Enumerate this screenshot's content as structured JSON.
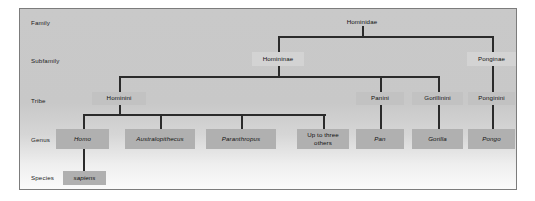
{
  "figure": {
    "panel_background": "#c9c9c9",
    "border_color": "#7c7c7c",
    "connector_color": "#2b2b2b"
  },
  "ranks": [
    {
      "id": "family",
      "label": "Family"
    },
    {
      "id": "subfamily",
      "label": "Subfamily"
    },
    {
      "id": "tribe",
      "label": "Tribe"
    },
    {
      "id": "genus",
      "label": "Genus"
    },
    {
      "id": "species",
      "label": "Species"
    }
  ],
  "nodes": {
    "family": [
      {
        "id": "hominidae",
        "label": "Hominidae",
        "box": "plain",
        "italic": false
      }
    ],
    "subfamily": [
      {
        "id": "homininae",
        "label": "Homininae",
        "box": "light",
        "italic": false
      },
      {
        "id": "ponginae",
        "label": "Ponginae",
        "box": "light",
        "italic": false
      }
    ],
    "tribe": [
      {
        "id": "hominini",
        "label": "Hominini",
        "box": "mid",
        "italic": false
      },
      {
        "id": "panini",
        "label": "Panini",
        "box": "mid",
        "italic": false
      },
      {
        "id": "gorillinini",
        "label": "Gorillinini",
        "box": "mid",
        "italic": false
      },
      {
        "id": "ponginini",
        "label": "Ponginini",
        "box": "mid",
        "italic": false
      }
    ],
    "genus": [
      {
        "id": "homo",
        "label": "Homo",
        "box": "dark",
        "italic": true
      },
      {
        "id": "australopithecus",
        "label": "Australopithecus",
        "box": "dark",
        "italic": true
      },
      {
        "id": "paranthropus",
        "label": "Paranthropus",
        "box": "dark",
        "italic": true
      },
      {
        "id": "others",
        "label": "Up to three others",
        "box": "dark",
        "italic": false
      },
      {
        "id": "pan",
        "label": "Pan",
        "box": "dark",
        "italic": true
      },
      {
        "id": "gorilla",
        "label": "Gorilla",
        "box": "dark",
        "italic": true
      },
      {
        "id": "pongo",
        "label": "Pongo",
        "box": "dark",
        "italic": true
      }
    ],
    "species": [
      {
        "id": "sapiens",
        "label": "sapiens",
        "box": "dark",
        "italic": true
      }
    ]
  }
}
